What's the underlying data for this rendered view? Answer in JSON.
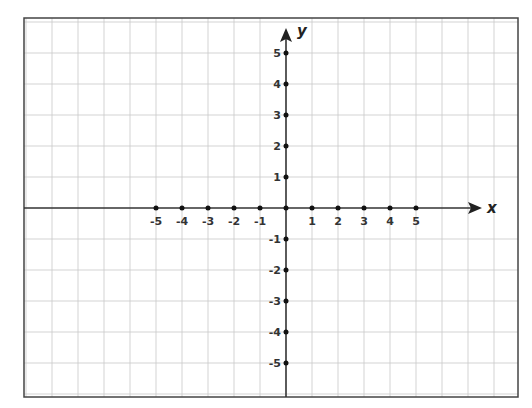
{
  "diagram": {
    "type": "cartesian-coordinate-plane",
    "axes": {
      "x": {
        "label": "x",
        "ticks": [
          -5,
          -4,
          -3,
          -2,
          -1,
          1,
          2,
          3,
          4,
          5
        ]
      },
      "y": {
        "label": "y",
        "ticks": [
          5,
          4,
          3,
          2,
          1,
          -1,
          -2,
          -3,
          -4,
          -5
        ]
      }
    },
    "x_tick_labels": [
      "-5",
      "-4",
      "-3",
      "-2",
      "-1",
      "1",
      "2",
      "3",
      "4",
      "5"
    ],
    "y_tick_labels": [
      "5",
      "4",
      "3",
      "2",
      "1",
      "-1",
      "-2",
      "-3",
      "-4",
      "-5"
    ],
    "grid": true
  },
  "colors": {
    "background": "#ffffff",
    "frame": "#444444",
    "grid": "#c8c8c8",
    "axis": "#333333",
    "point": "#111111"
  }
}
